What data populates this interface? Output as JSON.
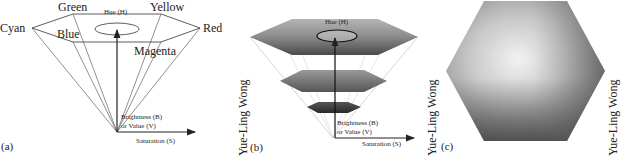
{
  "panels": {
    "a": {
      "label": "(a)",
      "vertices": {
        "green": "Green",
        "yellow": "Yellow",
        "cyan": "Cyan",
        "red": "Red",
        "blue": "Blue",
        "magenta": "Magenta"
      },
      "hue_label": "Hue (H)",
      "brightness_label_1": "Brightness (B)",
      "brightness_label_2": "or Value (V)",
      "saturation_label": "Saturation (S)"
    },
    "b": {
      "label": "(b)",
      "hue_label": "Hue (H)",
      "brightness_label_1": "Brightness (B)",
      "brightness_label_2": "or Value (V)",
      "saturation_label": "Saturation (S)"
    },
    "c": {
      "label": "(c)"
    }
  },
  "credits": [
    "Yue-Ling Wong",
    "Yue-Ling Wong"
  ]
}
